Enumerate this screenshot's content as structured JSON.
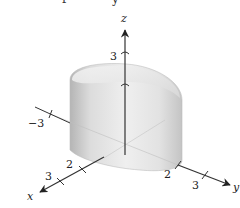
{
  "figure": {
    "type": "3d-surface-plot",
    "top_cropped_text": [
      "f",
      "y"
    ],
    "axes": {
      "z": {
        "label": "z",
        "ticks": [
          {
            "value": "3"
          }
        ]
      },
      "x": {
        "label": "x",
        "ticks": [
          {
            "value": "2"
          },
          {
            "value": "3"
          }
        ]
      },
      "y": {
        "label": "y",
        "ticks": [
          {
            "value": "2"
          },
          {
            "value": "3"
          }
        ]
      },
      "neg_y": {
        "ticks": [
          {
            "value": "−3"
          }
        ]
      }
    },
    "colors": {
      "surface_light": "#f2f2f2",
      "surface_mid": "#d6d6d6",
      "surface_dark": "#b8b8b8",
      "axis": "#333333"
    }
  }
}
